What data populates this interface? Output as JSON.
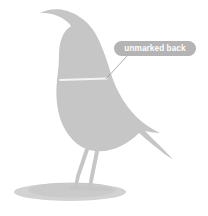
{
  "figure": {
    "title": "unmarked back",
    "background_color": "#ffffff",
    "silhouette_color": "#c6c6c6",
    "shadow_color": "#cfcfcf",
    "width": 208,
    "height": 216
  },
  "annotation": {
    "label": "unmarked back",
    "pill": {
      "fill_color": "#b4b4b4",
      "text_color": "#ffffff",
      "x": 114,
      "y": 41,
      "width": 82,
      "height": 15,
      "radius": 7.5,
      "center_x": 155,
      "center_y": 48.5
    },
    "leader_line": {
      "color": "#9a9a9a",
      "from_x": 127,
      "from_y": 56,
      "to_x": 106,
      "to_y": 79,
      "width": 0.8
    },
    "back_marker_line": {
      "color": "#f4f4f4",
      "from_x": 60,
      "from_y": 80,
      "to_x": 107,
      "to_y": 78.5,
      "width": 1.6
    }
  },
  "parts": {
    "body_name": "bird-body-silhouette",
    "beak_tip_x": 40,
    "beak_tip_y": 13,
    "tail_tip_x": 173,
    "tail_tip_y": 159,
    "ground_shadow_cx": 70,
    "ground_shadow_cy": 192,
    "ground_shadow_rx": 56,
    "ground_shadow_ry": 9,
    "leg_color": "#c6c6c6",
    "leg_front_label": "front-leg",
    "leg_back_label": "back-leg"
  }
}
